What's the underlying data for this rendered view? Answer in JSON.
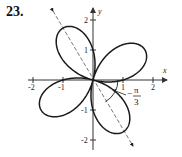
{
  "problem": {
    "number": "23."
  },
  "axes": {
    "x_label": "x",
    "y_label": "y",
    "x_ticks": [
      "-2",
      "-1",
      "1",
      "2"
    ],
    "y_ticks": [
      "2",
      "1",
      "-1",
      "-2"
    ]
  },
  "annotation": {
    "angle_minus": "−",
    "angle_num": "π",
    "angle_den": "3"
  },
  "colors": {
    "curve": "#1a1a1a",
    "axis": "#333333",
    "dashed": "#555555"
  },
  "chart_data": {
    "type": "polar-curve",
    "title": "23.",
    "equation_hint": "r = 2cos(2(theta - 2pi/3))",
    "petal_length": 2,
    "petal_directions_deg": [
      120,
      30,
      -60,
      210
    ],
    "axis_ranges": {
      "x": [
        -2,
        2
      ],
      "y": [
        -2,
        2
      ]
    },
    "rotation_angle_label": "-pi/3",
    "xlabel": "x",
    "ylabel": "y"
  }
}
